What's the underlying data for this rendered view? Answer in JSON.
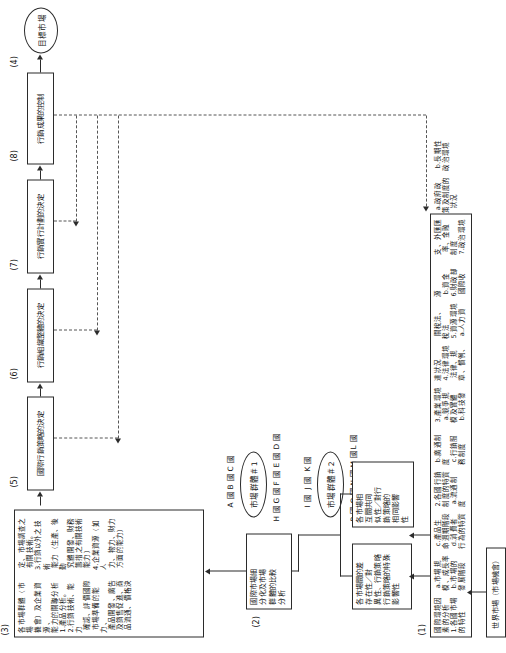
{
  "diagram": {
    "orientation": "rotated-90-ccw",
    "steps": {
      "s1": "(1)",
      "s2": "(2)",
      "s3": "(3)",
      "s4": "(4)",
      "s5": "(5)",
      "s6": "(6)",
      "s7": "(7)",
      "s8": "(8)"
    },
    "start_node": "世界市場（市場機會）",
    "end_node": "目標市場",
    "box1": "國際環境因素的分析\n1.各國市場的特性\n a.市場規模、成長率\n b.市場的發展階段\n c.產品生命週期階段\n d.消費者行為的特質\n2.各國行銷制度的特質\n a.流通制度\n b.廣通制度\n c.行銷服務制度\n3.產業環境\n a.競爭規模及實體\n b.科技發達狀況\n4.法律環境\n 法律、規章、慣例、\n 關稅法、稅法\n5.資源環境\n a.人力資源\n b.資金\n6.財政部\n 國際收支、外匯匯\n 率、金融制度\n7.政治環境\n a.政府政策及制度的\n  狀況\n b.長期性政治環境",
    "box_left_a": "各市場間的差\n存在性／對\n異性、行銷策略\n行銷策略的特殊\n影響性",
    "box_left_b": "各市場相\n互間共同\n似性／對行\n銷策略的\n相同影響\n性",
    "box2": "國際市場細\n分化及市場\n群體的比較\n分析",
    "box3": "各市場群體（市場\n機會）及企業資源、\n能力的關聯分析\n1.產品分析。\n2.行銷技術、能力\n 確認、評價國際\n 市場準備的能力、\n 產品開發、廣告\n 及銷售促進、商\n 品流通、價格決\n 定、市場調查之\n 有關技術。\n3.行銷以外之技術\n 能力（生產、後勤\n 究體開發、財務\n 籌措之有關技術\n 能力）\n4.企業資源（如人\n 力、物力、財力\n 方面的能力）",
    "box5": "國際行銷策略的決定",
    "box6": "行銷組織整體的決定",
    "box7": "行銷實行計劃的決定",
    "box8": "行銷成果的控制",
    "market_group_1": {
      "label": "市場群體＃1",
      "countries_upper": [
        "A 國",
        "B 國",
        "C 國"
      ],
      "countries_lower": [
        "H 國",
        "G 國",
        "F 國",
        "E 國",
        "D 國"
      ]
    },
    "market_group_2": {
      "label": "市場群體＃2",
      "countries_upper": [
        "I 國",
        "J 國",
        "K 國"
      ],
      "countries_lower": [
        "P 國",
        "O 國",
        "N 國",
        "M 國",
        "L 國"
      ]
    }
  },
  "colors": {
    "stroke": "#2b2b2b",
    "dashed": "#555555",
    "background": "#ffffff"
  }
}
